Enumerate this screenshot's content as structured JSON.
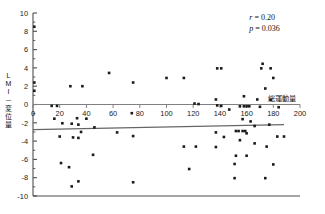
{
  "chart_data": {
    "type": "scatter",
    "title": "",
    "xlabel": "総運動量",
    "ylabel": "LMI－変位量",
    "ylabel_chars": "L\nM\nI\n－\n変\n位\n量",
    "xlim": [
      0,
      200
    ],
    "ylim": [
      -10,
      10
    ],
    "xticks": [
      0,
      20,
      40,
      60,
      80,
      100,
      120,
      140,
      160,
      180,
      200
    ],
    "xtick_labels": [
      "0",
      "20",
      "40",
      "60",
      "80",
      "100",
      "120",
      "140",
      "160",
      "180",
      "200"
    ],
    "yticks": [
      -10,
      -8,
      -6,
      -4,
      -2,
      0,
      2,
      4,
      6,
      8,
      10
    ],
    "ytick_labels": [
      "-10",
      "-8",
      "-6",
      "-4",
      "-2",
      "0",
      "2",
      "4",
      "6",
      "8",
      "10"
    ],
    "minor_ytick_step": 1,
    "grid": false,
    "legend": null,
    "zero_line": {
      "y": 0,
      "color": "#808080"
    },
    "trendline": {
      "x0": 0,
      "y0": -2.75,
      "x1": 188,
      "y1": -2.2,
      "color": "#666666",
      "slope": 0.0029,
      "intercept": -2.75
    },
    "annotations": [
      {
        "name": "correlation-coefficient",
        "symbol": "r",
        "operator": "=",
        "value": "0.20",
        "x": 162,
        "y": 9.2
      },
      {
        "name": "p-value",
        "symbol": "p",
        "operator": "=",
        "value": "0.036",
        "x": 162,
        "y": 8.0
      }
    ],
    "marker": {
      "shape": "square",
      "size": 2.6,
      "color": "#1a1a1a"
    },
    "points": [
      {
        "x": 1,
        "y": 8.5
      },
      {
        "x": 1,
        "y": 2.4
      },
      {
        "x": 1,
        "y": 1.5
      },
      {
        "x": 28,
        "y": 2.0
      },
      {
        "x": 37,
        "y": 2.0
      },
      {
        "x": 57,
        "y": 3.45
      },
      {
        "x": 75,
        "y": 2.4
      },
      {
        "x": 100,
        "y": 2.9
      },
      {
        "x": 113,
        "y": 2.9
      },
      {
        "x": 138,
        "y": 3.95
      },
      {
        "x": 141,
        "y": 3.95
      },
      {
        "x": 172,
        "y": 4.45
      },
      {
        "x": 171,
        "y": 3.95
      },
      {
        "x": 178,
        "y": 3.95
      },
      {
        "x": 180,
        "y": 2.9
      },
      {
        "x": 174,
        "y": 1.75
      },
      {
        "x": 158,
        "y": 0.9
      },
      {
        "x": 168,
        "y": 0.55
      },
      {
        "x": 178,
        "y": 0.5
      },
      {
        "x": 137,
        "y": 0.55
      },
      {
        "x": 121,
        "y": 0.1
      },
      {
        "x": 124,
        "y": 0.05
      },
      {
        "x": 14,
        "y": -0.15
      },
      {
        "x": 18,
        "y": -0.15
      },
      {
        "x": 138,
        "y": -0.1
      },
      {
        "x": 141,
        "y": -0.15
      },
      {
        "x": 155,
        "y": -0.2
      },
      {
        "x": 158,
        "y": -0.2
      },
      {
        "x": 160,
        "y": -0.2
      },
      {
        "x": 162,
        "y": -0.2
      },
      {
        "x": 170,
        "y": -0.25
      },
      {
        "x": 184,
        "y": -0.3
      },
      {
        "x": 147,
        "y": -0.55
      },
      {
        "x": 74,
        "y": -0.95
      },
      {
        "x": 22,
        "y": -2.05
      },
      {
        "x": 16,
        "y": -1.55
      },
      {
        "x": 33,
        "y": -1.5
      },
      {
        "x": 40,
        "y": -1.55
      },
      {
        "x": 29,
        "y": -2.1
      },
      {
        "x": 34,
        "y": -2.2
      },
      {
        "x": 46,
        "y": -2.5
      },
      {
        "x": 157,
        "y": -1.6
      },
      {
        "x": 163,
        "y": -1.85
      },
      {
        "x": 166,
        "y": -2.35
      },
      {
        "x": 177,
        "y": -2.2
      },
      {
        "x": 36,
        "y": -3.0
      },
      {
        "x": 20,
        "y": -3.5
      },
      {
        "x": 30,
        "y": -3.6
      },
      {
        "x": 34,
        "y": -3.65
      },
      {
        "x": 63,
        "y": -3.05
      },
      {
        "x": 75,
        "y": -3.45
      },
      {
        "x": 137,
        "y": -3.05
      },
      {
        "x": 152,
        "y": -2.9
      },
      {
        "x": 154,
        "y": -2.9
      },
      {
        "x": 157,
        "y": -2.9
      },
      {
        "x": 159,
        "y": -2.9
      },
      {
        "x": 143,
        "y": -3.55
      },
      {
        "x": 160,
        "y": -3.15
      },
      {
        "x": 183,
        "y": -3.5
      },
      {
        "x": 188,
        "y": -3.5
      },
      {
        "x": 155,
        "y": -3.9
      },
      {
        "x": 166,
        "y": -4.25
      },
      {
        "x": 113,
        "y": -4.6
      },
      {
        "x": 122,
        "y": -4.6
      },
      {
        "x": 137,
        "y": -4.65
      },
      {
        "x": 175,
        "y": -4.6
      },
      {
        "x": 45,
        "y": -5.5
      },
      {
        "x": 152,
        "y": -5.6
      },
      {
        "x": 160,
        "y": -5.6
      },
      {
        "x": 21,
        "y": -6.4
      },
      {
        "x": 151,
        "y": -6.5
      },
      {
        "x": 180,
        "y": -6.55
      },
      {
        "x": 117,
        "y": -7.05
      },
      {
        "x": 27,
        "y": -6.85
      },
      {
        "x": 34,
        "y": -8.4
      },
      {
        "x": 29,
        "y": -8.95
      },
      {
        "x": 75,
        "y": -8.5
      },
      {
        "x": 151,
        "y": -8.05
      },
      {
        "x": 174,
        "y": -8.05
      }
    ]
  }
}
